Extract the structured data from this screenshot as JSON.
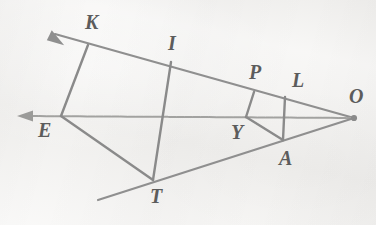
{
  "figure": {
    "background_color": "#f3f2f0",
    "line_color": "#8f8f8f",
    "label_color": "#5c5c5c",
    "width": 376,
    "height": 225
  },
  "points": [
    {
      "id": "K",
      "label": "K",
      "x": 88,
      "y": 45,
      "label_x": 85,
      "label_y": 12
    },
    {
      "id": "I",
      "label": "I",
      "x": 171,
      "y": 62,
      "label_x": 168,
      "label_y": 33
    },
    {
      "id": "P",
      "label": "P",
      "x": 254,
      "y": 92,
      "label_x": 249,
      "label_y": 62
    },
    {
      "id": "L",
      "label": "L",
      "x": 285,
      "y": 97,
      "label_x": 292,
      "label_y": 70
    },
    {
      "id": "O",
      "label": "O",
      "x": 354,
      "y": 118,
      "label_x": 349,
      "label_y": 86
    },
    {
      "id": "E",
      "label": "E",
      "x": 61,
      "y": 116,
      "label_x": 38,
      "label_y": 120
    },
    {
      "id": "Y",
      "label": "Y",
      "x": 246,
      "y": 117,
      "label_x": 231,
      "label_y": 122
    },
    {
      "id": "A",
      "label": "A",
      "x": 283,
      "y": 140,
      "label_x": 279,
      "label_y": 148
    },
    {
      "id": "T",
      "label": "T",
      "x": 153,
      "y": 180,
      "label_x": 150,
      "label_y": 186
    }
  ],
  "rays": [
    {
      "id": "ray-upper",
      "from": "O",
      "through": "K",
      "arrow_x": 50,
      "arrow_y": 33,
      "arrowhead": true
    },
    {
      "id": "ray-middle",
      "from": "O",
      "through": "E",
      "arrow_x": 18,
      "arrow_y": 116,
      "arrowhead": true
    },
    {
      "id": "ray-lower",
      "from": "O",
      "through": "T",
      "arrow_x": 98,
      "arrow_y": 200,
      "arrowhead": false
    }
  ],
  "segments": [
    {
      "id": "segment-KE",
      "from": "K",
      "to": "E"
    },
    {
      "id": "segment-IT",
      "from": "I",
      "to": "T"
    },
    {
      "id": "segment-PY",
      "from": "P",
      "to": "Y"
    },
    {
      "id": "segment-LA",
      "from": "L",
      "to": "A"
    },
    {
      "id": "segment-ET",
      "from": "E",
      "to": "T"
    },
    {
      "id": "segment-YA",
      "from": "Y",
      "to": "A"
    }
  ]
}
